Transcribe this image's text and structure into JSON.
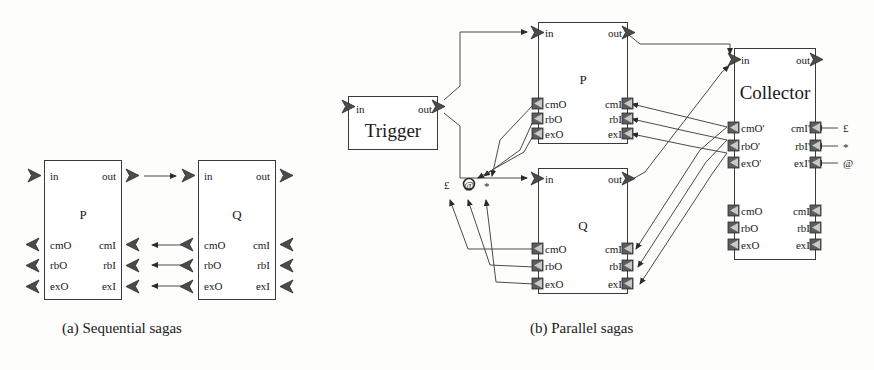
{
  "figure": {
    "captions": [
      {
        "id": "a",
        "text": "(a) Sequential sagas"
      },
      {
        "id": "b",
        "text": "(b) Parallel sagas"
      }
    ]
  },
  "port_labels": {
    "in": "in",
    "out": "out",
    "cmO": "cmO",
    "cmI": "cmI",
    "rbO": "rbO",
    "rbI": "rbI",
    "exO": "exO",
    "exI": "exI",
    "cmOp": "cmO'",
    "cmIp": "cmI'",
    "rbOp": "rbO'",
    "rbIp": "rbI'",
    "exOp": "exO'",
    "exIp": "exI'"
  },
  "diagram_a": {
    "name": "Sequential sagas",
    "components": [
      {
        "id": "P",
        "name": "P",
        "ports_top": [
          "in",
          "out"
        ],
        "ports_bottom_left": [
          "cmO",
          "rbO",
          "exO"
        ],
        "ports_bottom_right": [
          "cmI",
          "rbI",
          "exI"
        ]
      },
      {
        "id": "Q",
        "name": "Q",
        "ports_top": [
          "in",
          "out"
        ],
        "ports_bottom_left": [
          "cmO",
          "rbO",
          "exO"
        ],
        "ports_bottom_right": [
          "cmI",
          "rbI",
          "exI"
        ]
      }
    ],
    "connections": [
      {
        "from": "P.out",
        "to": "Q.in"
      },
      {
        "from": "Q.cmO",
        "to": "P.cmI"
      },
      {
        "from": "Q.rbO",
        "to": "P.rbI"
      },
      {
        "from": "Q.exO",
        "to": "P.exI"
      }
    ]
  },
  "diagram_b": {
    "name": "Parallel sagas",
    "components": [
      {
        "id": "Trigger",
        "name": "Trigger",
        "ports_top": [
          "in",
          "out"
        ]
      },
      {
        "id": "P",
        "name": "P",
        "ports_top": [
          "in",
          "out"
        ],
        "ports_bottom_left": [
          "cmO",
          "rbO",
          "exO"
        ],
        "ports_bottom_right": [
          "cmI",
          "rbI",
          "exI"
        ]
      },
      {
        "id": "Q",
        "name": "Q",
        "ports_top": [
          "in",
          "out"
        ],
        "ports_bottom_left": [
          "cmO",
          "rbO",
          "exO"
        ],
        "ports_bottom_right": [
          "cmI",
          "rbI",
          "exI"
        ]
      },
      {
        "id": "Collector",
        "name": "Collector",
        "ports_top": [
          "in",
          "out"
        ],
        "ports_primed_left": [
          "cmO'",
          "rbO'",
          "exO'"
        ],
        "ports_primed_right": [
          "cmI'",
          "rbI'",
          "exI'"
        ],
        "ports_bottom_left": [
          "cmO",
          "rbO",
          "exO"
        ],
        "ports_bottom_right": [
          "cmI",
          "rbI",
          "exI"
        ]
      }
    ],
    "junction_symbols": [
      {
        "id": "pound",
        "glyph": "£"
      },
      {
        "id": "at",
        "glyph": "@"
      },
      {
        "id": "star",
        "glyph": "*"
      }
    ],
    "external_symbols": [
      {
        "glyph": "£",
        "port": "cmI'"
      },
      {
        "glyph": "*",
        "port": "rbI'"
      },
      {
        "glyph": "@",
        "port": "exI'"
      }
    ],
    "connections": [
      {
        "from": "Trigger.out",
        "to": "P.in"
      },
      {
        "from": "Trigger.out",
        "to": "Q.in"
      },
      {
        "from": "P.out",
        "to": "Collector.in"
      },
      {
        "from": "Q.out",
        "to": "Collector.in"
      },
      {
        "from": "Collector.cmO'",
        "to": "P.cmI"
      },
      {
        "from": "Collector.rbO'",
        "to": "P.rbI"
      },
      {
        "from": "Collector.exO'",
        "to": "P.exI"
      },
      {
        "from": "Collector.cmO'",
        "to": "Q.cmI"
      },
      {
        "from": "Collector.rbO'",
        "to": "Q.rbI"
      },
      {
        "from": "Collector.exO'",
        "to": "Q.exI"
      },
      {
        "from": "P.cmO",
        "to": "pound"
      },
      {
        "from": "P.rbO",
        "to": "at"
      },
      {
        "from": "P.exO",
        "to": "star"
      },
      {
        "from": "Q.cmO",
        "to": "pound"
      },
      {
        "from": "Q.rbO",
        "to": "at"
      },
      {
        "from": "Q.exO",
        "to": "star"
      }
    ]
  },
  "colors": {
    "stroke": "#3a3a3a",
    "wire": "#4a4a4a",
    "port_fill": "#5a5a5a",
    "background": "#fdfdfb"
  }
}
